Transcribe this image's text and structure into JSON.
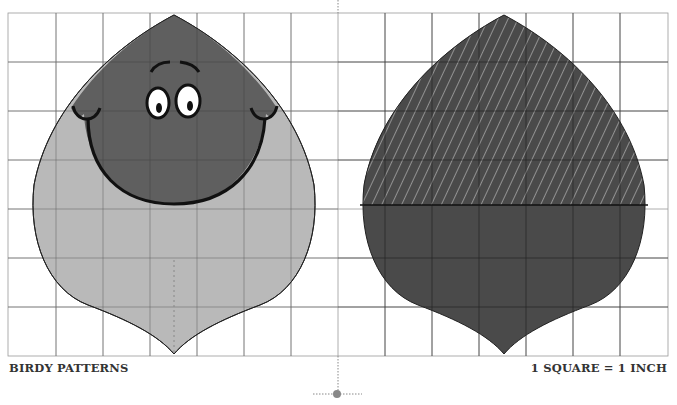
{
  "document": {
    "title": "BIRDY PATTERNS",
    "scale_note": "1 SQUARE = 1 INCH"
  },
  "patterns": [
    {
      "name": "body-front",
      "description": "Birdy body front with face, light lower body and dark head"
    },
    {
      "name": "body-back",
      "description": "Birdy body back, dark with hatched upper half"
    }
  ],
  "colors": {
    "grid": "#9a9a9a",
    "light_fill": "#b9b9b9",
    "dark_fill": "#5f5f5f",
    "back_fill": "#4a4a4a",
    "outline": "#222222",
    "divider": "#888888"
  },
  "grid": {
    "cell_px": 47,
    "columns": 14,
    "rows": 7
  }
}
